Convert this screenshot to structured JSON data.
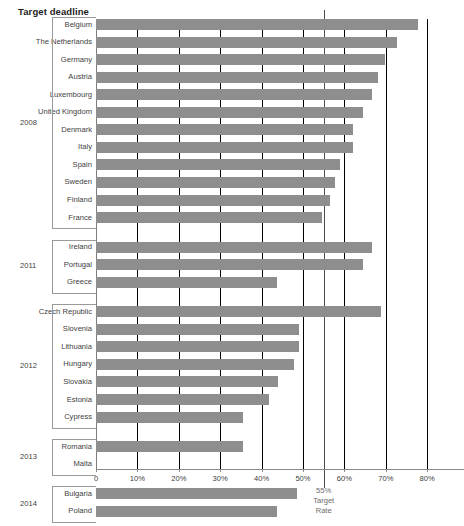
{
  "chart_data": {
    "type": "bar",
    "orientation": "horizontal",
    "title": "Target deadline",
    "xlabel": "",
    "ylabel": "",
    "xlim": [
      0,
      88.9
    ],
    "grid": true,
    "legend": null,
    "tick_labels": [
      "0",
      "10%",
      "20%",
      "30%",
      "40%",
      "50%",
      "60%",
      "70%",
      "80%"
    ],
    "tick_values": [
      0,
      10,
      20,
      30,
      40,
      50,
      60,
      70,
      80
    ],
    "target_line": {
      "value": 55,
      "label_lines": [
        "55%",
        "Target",
        "Rate"
      ]
    },
    "bar_color": "#8e8e8e",
    "groups": [
      {
        "year": "2008",
        "categories": [
          "Belgium",
          "The Netherlands",
          "Germany",
          "Austria",
          "Luxembourg",
          "United Kingdom",
          "Denmark",
          "Italy",
          "Spain",
          "Sweden",
          "Finland",
          "France"
        ],
        "values": [
          77.8,
          72.7,
          69.9,
          68.2,
          66.7,
          64.5,
          62.1,
          62.0,
          58.9,
          57.7,
          56.5,
          54.6
        ]
      },
      {
        "year": "2011",
        "categories": [
          "Ireland",
          "Portugal",
          "Greece"
        ],
        "values": [
          66.7,
          64.5,
          43.7
        ]
      },
      {
        "year": "2012",
        "categories": [
          "Czech Republic",
          "Slovenia",
          "Lithuania",
          "Hungary",
          "Slovakia",
          "Estonia",
          "Cypress"
        ],
        "values": [
          68.8,
          49.0,
          49.0,
          47.8,
          44.0,
          41.8,
          35.5
        ]
      },
      {
        "year": "2013",
        "categories": [
          "Romania",
          "Malta"
        ],
        "values": [
          35.5,
          0.0
        ]
      },
      {
        "year": "2014",
        "categories": [
          "Bulgaria",
          "Poland"
        ],
        "values": [
          48.6,
          43.7
        ]
      },
      {
        "year": "2015",
        "categories": [
          "Latvia"
        ],
        "values": [
          47.6
        ]
      }
    ]
  }
}
